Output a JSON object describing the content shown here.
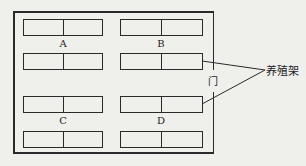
{
  "diagram": {
    "type": "floor-plan",
    "zones": [
      {
        "label": "A"
      },
      {
        "label": "B"
      },
      {
        "label": "C"
      },
      {
        "label": "D"
      }
    ],
    "door_label": "门",
    "callout_label": "养殖架",
    "colors": {
      "line": "#2a2a2a",
      "background": "#efefec"
    }
  }
}
